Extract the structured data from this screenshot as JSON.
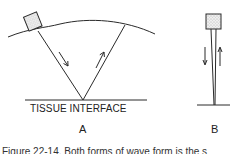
{
  "diagram_a": {
    "interface_label": "TISSUE INTERFACE",
    "panel_label": "A",
    "beam_directions": [
      "down",
      "up"
    ]
  },
  "diagram_b": {
    "panel_label": "B",
    "beam_directions": [
      "down",
      "up"
    ]
  },
  "caption": "Figure 22-14. Both forms of wave form is the s",
  "colors": {
    "line": "#2a2a2a",
    "background": "#ffffff",
    "probe_fill": "#e4e4e4"
  }
}
